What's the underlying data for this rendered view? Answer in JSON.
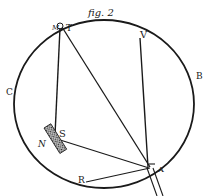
{
  "figure": {
    "caption": "fig. 2",
    "ink_color": "#1a1a1a",
    "background": "#ffffff"
  },
  "labels": {
    "C": "C",
    "B": "B",
    "V": "V",
    "T": "T",
    "M_top": "M",
    "S": "S",
    "N": "N",
    "R": "R",
    "A": "A"
  }
}
